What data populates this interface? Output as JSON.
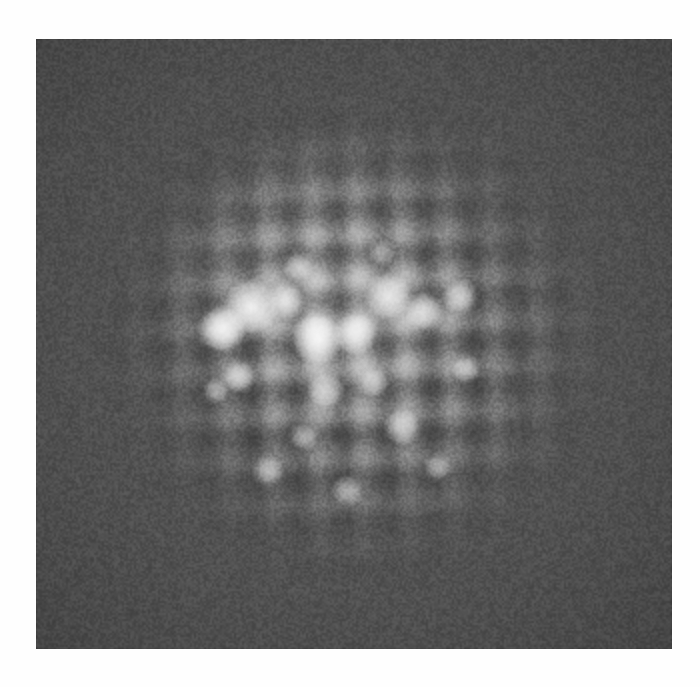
{
  "page": {
    "background_color": "#fefefe",
    "ghost_text": "",
    "ghost_text_note": "illegible bleed-through marks at bottom of scanned page"
  },
  "micrograph": {
    "caption": "",
    "type": "high-resolution transmission electron micrograph",
    "plate": {
      "left": 36,
      "top": 39,
      "width": 636,
      "height": 610,
      "background_color": "#575757",
      "darkest_color": "#3e3e3e",
      "brightest_color": "#ffffff",
      "mid_color": "#9a9a9a"
    },
    "lattice": {
      "symmetry": "square",
      "spacing_px": 45,
      "rotation_deg": -1.6,
      "contrast": "dark atomic columns on bright background",
      "columns_visible": 14,
      "rows_visible": 13,
      "coherent_region_radius_px": 270
    },
    "illumination": {
      "profile": "radial",
      "center_x_pct": 50.5,
      "center_y_pct": 49,
      "falloff": "gaussian"
    },
    "hot_spots": [
      {
        "x": 215,
        "y": 268,
        "r": 26,
        "intensity": 1.0
      },
      {
        "x": 186,
        "y": 290,
        "r": 22,
        "intensity": 0.96
      },
      {
        "x": 250,
        "y": 262,
        "r": 18,
        "intensity": 0.92
      },
      {
        "x": 282,
        "y": 300,
        "r": 24,
        "intensity": 1.0
      },
      {
        "x": 318,
        "y": 296,
        "r": 20,
        "intensity": 0.9
      },
      {
        "x": 352,
        "y": 258,
        "r": 22,
        "intensity": 0.94
      },
      {
        "x": 388,
        "y": 272,
        "r": 18,
        "intensity": 0.82
      },
      {
        "x": 424,
        "y": 258,
        "r": 16,
        "intensity": 0.78
      },
      {
        "x": 262,
        "y": 228,
        "r": 14,
        "intensity": 0.7
      },
      {
        "x": 203,
        "y": 338,
        "r": 15,
        "intensity": 0.72
      },
      {
        "x": 290,
        "y": 352,
        "r": 17,
        "intensity": 0.74
      },
      {
        "x": 338,
        "y": 344,
        "r": 14,
        "intensity": 0.66
      },
      {
        "x": 366,
        "y": 388,
        "r": 17,
        "intensity": 0.72
      },
      {
        "x": 268,
        "y": 398,
        "r": 13,
        "intensity": 0.62
      },
      {
        "x": 232,
        "y": 432,
        "r": 14,
        "intensity": 0.6
      },
      {
        "x": 312,
        "y": 452,
        "r": 15,
        "intensity": 0.58
      },
      {
        "x": 402,
        "y": 428,
        "r": 13,
        "intensity": 0.55
      },
      {
        "x": 180,
        "y": 352,
        "r": 12,
        "intensity": 0.58
      },
      {
        "x": 430,
        "y": 330,
        "r": 13,
        "intensity": 0.6
      },
      {
        "x": 346,
        "y": 214,
        "r": 12,
        "intensity": 0.58
      }
    ],
    "noise": {
      "kind": "film-grain",
      "amount_pct": 40
    }
  }
}
